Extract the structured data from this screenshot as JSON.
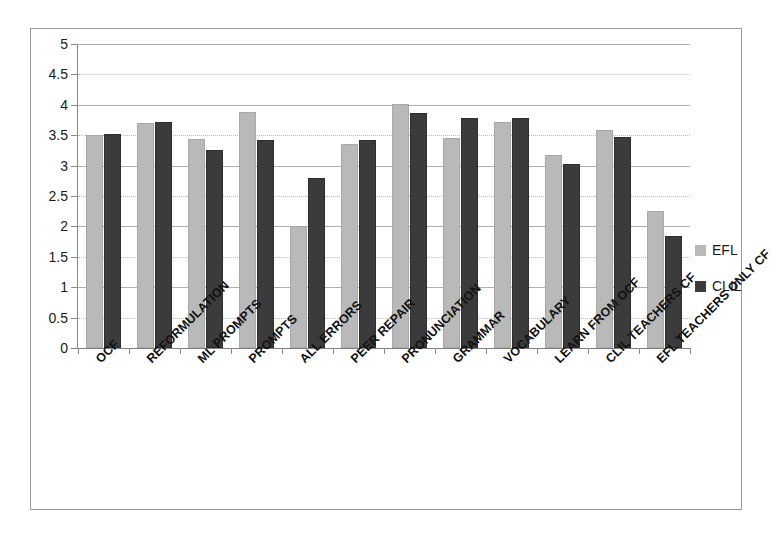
{
  "chart_data": {
    "type": "bar",
    "title": "",
    "subtitle": "",
    "xlabel": "",
    "ylabel": "",
    "ylim": [
      0,
      5
    ],
    "ytick_step": 0.5,
    "grid": true,
    "legend_position": "right",
    "categories": [
      "OCF",
      "REFORMULATION",
      "ML PROMPTS",
      "PROMPTS",
      "ALL ERRORS",
      "PEER REPAIR",
      "PRONUNCIATION",
      "GRAMMAR",
      "VOCABULARY",
      "LEARN FROM OCF",
      "CLIL TEACHERS CF",
      "EFL TEACHERS ONLY CF"
    ],
    "ytick_labels": [
      "0",
      "0.5",
      "1",
      "1.5",
      "2",
      "2.5",
      "3",
      "3.5",
      "4",
      "4.5",
      "5"
    ],
    "ytick_values": [
      0,
      0.5,
      1,
      1.5,
      2,
      2.5,
      3,
      3.5,
      4,
      4.5,
      5
    ],
    "series": [
      {
        "name": "EFL",
        "color": "#b9b9b9",
        "values": [
          3.5,
          3.7,
          3.43,
          3.88,
          2.0,
          3.35,
          4.02,
          3.45,
          3.72,
          3.18,
          3.58,
          2.25
        ]
      },
      {
        "name": "CLIL",
        "color": "#3b3b3b",
        "values": [
          3.52,
          3.72,
          3.25,
          3.42,
          2.8,
          3.42,
          3.87,
          3.78,
          3.78,
          3.02,
          3.47,
          1.85
        ]
      }
    ]
  },
  "legend": {
    "items": [
      {
        "label": "EFL",
        "color": "#b9b9b9"
      },
      {
        "label": "CLIL",
        "color": "#3b3b3b"
      }
    ]
  },
  "colors": {
    "efl": "#b9b9b9",
    "clil": "#3b3b3b",
    "gridline": "#b0b0b0",
    "axis": "#808080",
    "frame": "#9a9a9a",
    "text": "#1a1a1a"
  }
}
